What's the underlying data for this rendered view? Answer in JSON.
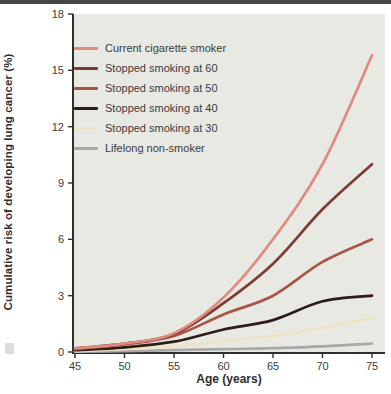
{
  "page": {
    "top_rule_color": "#464646",
    "background": "#ffffff"
  },
  "chart_data": {
    "type": "line",
    "title": "",
    "xlabel": "Age (years)",
    "ylabel": "Cumulative risk of developing lung cancer (%)",
    "x": [
      45,
      50,
      55,
      60,
      65,
      70,
      75
    ],
    "xticks": [
      45,
      50,
      55,
      60,
      65,
      70,
      75
    ],
    "yticks": [
      0,
      3,
      6,
      9,
      12,
      15,
      18
    ],
    "xlim": [
      45,
      75
    ],
    "ylim": [
      0,
      18
    ],
    "grid": false,
    "legend_position": "top-left-inside",
    "plot_bg": "#e9e9e4",
    "axis_color": "#2f2f2f",
    "tick_label_color": "#3c3c3c",
    "series": [
      {
        "name": "Current cigarette smoker",
        "color": "#e08a7f",
        "values": [
          0.2,
          0.45,
          1.0,
          2.9,
          6.0,
          10.0,
          15.8
        ]
      },
      {
        "name": "Stopped smoking at 60",
        "color": "#7c3b35",
        "values": [
          0.2,
          0.45,
          0.95,
          2.6,
          4.7,
          7.6,
          10.0
        ]
      },
      {
        "name": "Stopped smoking at 50",
        "color": "#a85548",
        "values": [
          0.15,
          0.4,
          0.85,
          2.0,
          3.0,
          4.8,
          6.0
        ]
      },
      {
        "name": "Stopped smoking at 40",
        "color": "#2e1c18",
        "values": [
          0.1,
          0.25,
          0.55,
          1.2,
          1.7,
          2.7,
          3.0
        ]
      },
      {
        "name": "Stopped smoking at 30",
        "color": "#ede4c4",
        "values": [
          0.05,
          0.15,
          0.3,
          0.6,
          0.85,
          1.3,
          1.8
        ]
      },
      {
        "name": "Lifelong non-smoker",
        "color": "#a8a8a8",
        "values": [
          0.02,
          0.05,
          0.1,
          0.15,
          0.2,
          0.3,
          0.45
        ]
      }
    ]
  }
}
